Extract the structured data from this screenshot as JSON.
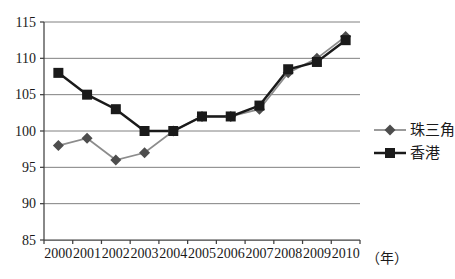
{
  "chart_data": {
    "type": "line",
    "categories": [
      "2000",
      "2001",
      "2002",
      "2003",
      "2004",
      "2005",
      "2006",
      "2007",
      "2008",
      "2009",
      "2010"
    ],
    "x_unit_label": "（年）",
    "series": [
      {
        "name": "珠三角",
        "values": [
          98,
          99,
          96,
          97,
          100,
          102,
          102,
          103,
          108,
          110,
          113
        ],
        "line_color": "#8c8c8c",
        "marker": "diamond",
        "marker_color": "#4d4d4d",
        "line_width": 1.75
      },
      {
        "name": "香港",
        "values": [
          108,
          105,
          103,
          100,
          100,
          102,
          102,
          103.5,
          108.5,
          109.5,
          112.5
        ],
        "line_color": "#1a1a1a",
        "marker": "square",
        "marker_color": "#1a1a1a",
        "line_width": 2.5
      }
    ],
    "ylim": [
      85,
      115
    ],
    "y_tick_step": 5,
    "grid": true,
    "legend_position": "right",
    "colors": {
      "grid": "#808080",
      "axis": "#404040",
      "background": "#ffffff",
      "text": "#1a1a1a"
    }
  }
}
